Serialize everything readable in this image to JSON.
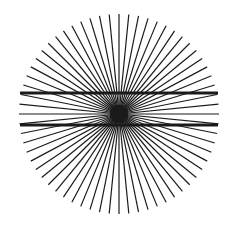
{
  "figure": {
    "background": "#ffffff",
    "center": [
      119,
      114
    ],
    "radius": 100,
    "ray_count": 64,
    "ray_color": "#1a1a1a",
    "ray_width": 1.2,
    "center_blob_radius": 9,
    "horizontal_lines": [
      {
        "y": 93,
        "x1": 20,
        "x2": 218,
        "width": 3,
        "color": "#1a1a1a"
      },
      {
        "y": 125,
        "x1": 20,
        "x2": 218,
        "width": 3,
        "color": "#1a1a1a"
      }
    ]
  }
}
